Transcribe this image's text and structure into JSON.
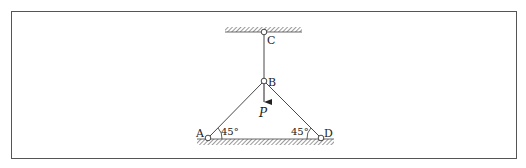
{
  "diagram": {
    "type": "truss-structure",
    "nodes": {
      "A": {
        "label": "A",
        "support": "pin-ground"
      },
      "B": {
        "label": "B",
        "support": "joint"
      },
      "C": {
        "label": "C",
        "support": "pin-ceiling"
      },
      "D": {
        "label": "D",
        "support": "pin-ground"
      }
    },
    "members": [
      "CB",
      "AB",
      "DB"
    ],
    "load": {
      "label": "P",
      "at": "B",
      "direction": "down"
    },
    "angles": {
      "at_A": "45°",
      "at_D": "45°"
    }
  }
}
